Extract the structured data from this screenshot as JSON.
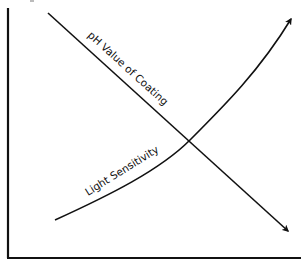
{
  "diagram": {
    "type": "relationship-graph",
    "axes": {
      "x_axis": {
        "label": "",
        "ticks": []
      },
      "y_axis": {
        "label": "",
        "ticks": []
      }
    },
    "series": [
      {
        "name": "pH Value of Coating",
        "label": "pH Value of Coating",
        "trend": "decreasing",
        "shape": "straight line with arrowhead",
        "color": "#111111"
      },
      {
        "name": "Light Sensitivity",
        "label": "Light Sensitivity",
        "trend": "increasing",
        "shape": "upward-curving line with arrowhead",
        "color": "#111111"
      }
    ],
    "intersection": "single crossing point near center-right of plot"
  },
  "colors": {
    "background": "#ffffff",
    "ink": "#111111"
  }
}
